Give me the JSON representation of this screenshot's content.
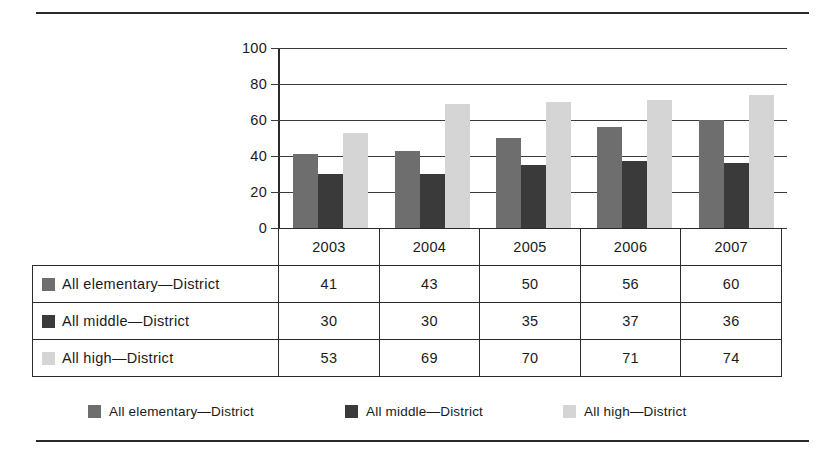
{
  "chart_data": {
    "type": "bar",
    "title": "",
    "xlabel": "",
    "ylabel": "",
    "ylim": [
      0,
      100
    ],
    "yticks": [
      0,
      20,
      40,
      60,
      80,
      100
    ],
    "grid": true,
    "legend_position": "bottom",
    "categories": [
      "2003",
      "2004",
      "2005",
      "2006",
      "2007"
    ],
    "series": [
      {
        "name": "All elementary—District",
        "color": "#6e6e6e",
        "values": [
          41,
          43,
          50,
          56,
          60
        ]
      },
      {
        "name": "All middle—District",
        "color": "#3a3a3a",
        "values": [
          30,
          30,
          35,
          37,
          36
        ]
      },
      {
        "name": "All high—District",
        "color": "#d5d5d5",
        "values": [
          53,
          69,
          70,
          71,
          74
        ]
      }
    ]
  },
  "table": {
    "header_row": [
      "",
      "2003",
      "2004",
      "2005",
      "2006",
      "2007"
    ],
    "rows": [
      {
        "label": "All elementary—District",
        "swatch": "elementary",
        "values": [
          "41",
          "43",
          "50",
          "56",
          "60"
        ]
      },
      {
        "label": "All middle—District",
        "swatch": "middle",
        "values": [
          "30",
          "30",
          "35",
          "37",
          "36"
        ]
      },
      {
        "label": "All high—District",
        "swatch": "high",
        "values": [
          "53",
          "69",
          "70",
          "71",
          "74"
        ]
      }
    ]
  },
  "legend": {
    "items": [
      {
        "label": "All elementary—District",
        "swatch": "elementary"
      },
      {
        "label": "All middle—District",
        "swatch": "middle"
      },
      {
        "label": "All high—District",
        "swatch": "high"
      }
    ]
  },
  "axis": {
    "tick_labels": [
      "100",
      "80",
      "60",
      "40",
      "20",
      "0"
    ]
  }
}
